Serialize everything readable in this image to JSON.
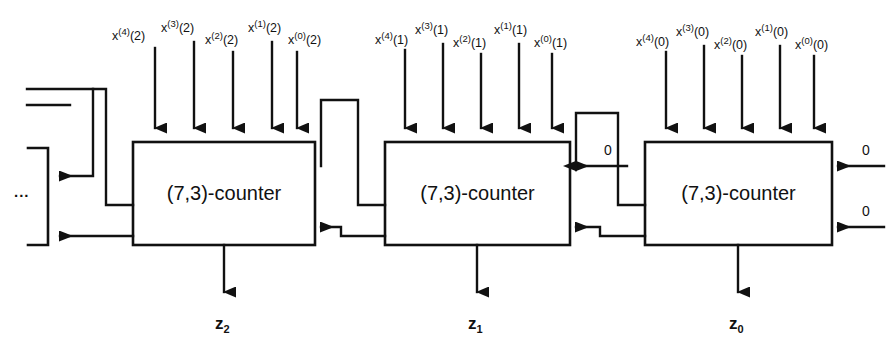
{
  "figure": {
    "line_color": "#111111",
    "background": "#ffffff"
  },
  "counters": [
    {
      "id": "counter-2",
      "label": "(7,3)-counter",
      "output_label": "z",
      "output_sub": "2",
      "inputs": [
        {
          "base": "x",
          "sup": "(4)",
          "arg": "(2)"
        },
        {
          "base": "x",
          "sup": "(3)",
          "arg": "(2)"
        },
        {
          "base": "x",
          "sup": "(2)",
          "arg": "(2)"
        },
        {
          "base": "x",
          "sup": "(1)",
          "arg": "(2)"
        },
        {
          "base": "x",
          "sup": "(0)",
          "arg": "(2)"
        }
      ],
      "side_inputs": []
    },
    {
      "id": "counter-1",
      "label": "(7,3)-counter",
      "output_label": "z",
      "output_sub": "1",
      "inputs": [
        {
          "base": "x",
          "sup": "(4)",
          "arg": "(1)"
        },
        {
          "base": "x",
          "sup": "(3)",
          "arg": "(1)"
        },
        {
          "base": "x",
          "sup": "(2)",
          "arg": "(1)"
        },
        {
          "base": "x",
          "sup": "(1)",
          "arg": "(1)"
        },
        {
          "base": "x",
          "sup": "(0)",
          "arg": "(1)"
        }
      ],
      "side_inputs": [
        {
          "value": "0",
          "position": "upper-right"
        }
      ]
    },
    {
      "id": "counter-0",
      "label": "(7,3)-counter",
      "output_label": "z",
      "output_sub": "0",
      "inputs": [
        {
          "base": "x",
          "sup": "(4)",
          "arg": "(0)"
        },
        {
          "base": "x",
          "sup": "(3)",
          "arg": "(0)"
        },
        {
          "base": "x",
          "sup": "(2)",
          "arg": "(0)"
        },
        {
          "base": "x",
          "sup": "(1)",
          "arg": "(0)"
        },
        {
          "base": "x",
          "sup": "(0)",
          "arg": "(0)"
        }
      ],
      "side_inputs": [
        {
          "value": "0",
          "position": "upper-right"
        },
        {
          "value": "0",
          "position": "lower-right"
        }
      ]
    }
  ],
  "continuation": {
    "label": "...",
    "description": "carry lines continuing to further counter stages on the left"
  }
}
